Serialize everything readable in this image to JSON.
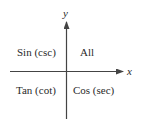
{
  "diagram": {
    "axes": {
      "x_label": "x",
      "y_label": "y"
    },
    "quadrants": {
      "q1": "All",
      "q2": "Sin (csc)",
      "q3": "Tan (cot)",
      "q4": "Cos (sec)"
    },
    "colors": {
      "line": "#444444",
      "text": "#2a2a2a"
    }
  }
}
